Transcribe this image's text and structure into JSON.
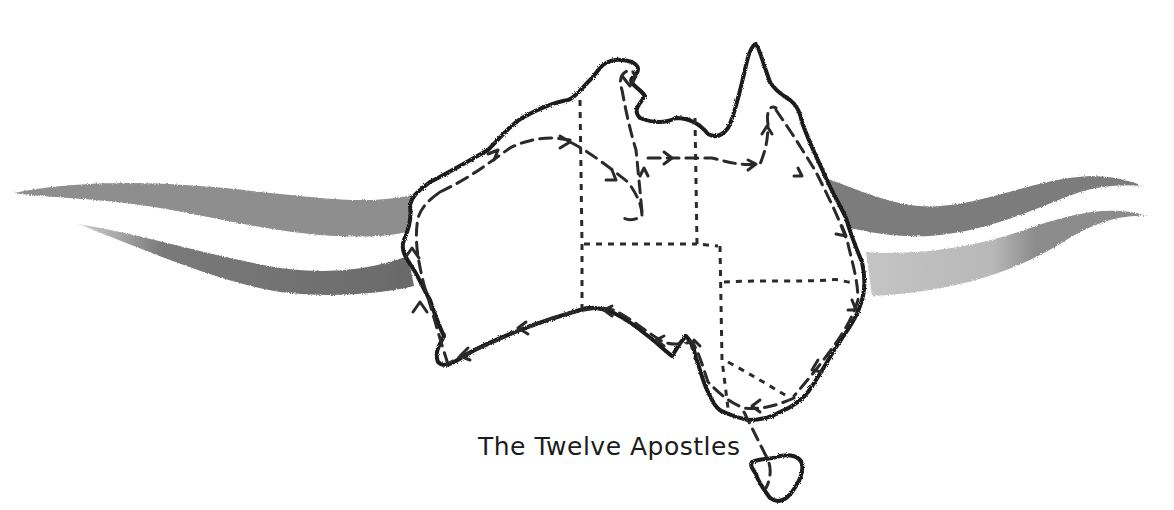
{
  "map": {
    "subject": "Australia route map",
    "labels": {
      "twelve_apostles": "The Twelve Apostles"
    },
    "colors": {
      "background": "#ffffff",
      "outline": "#1a1a1a",
      "route": "#2a2a2a",
      "border": "#2a2a2a",
      "swoosh_dark": "#6e6e6e",
      "swoosh_mid": "#8a8a8a",
      "swoosh_light": "#b9b9b9"
    }
  }
}
